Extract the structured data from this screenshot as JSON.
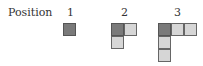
{
  "figure": {
    "row_label": "Position",
    "positions": [
      {
        "label": "1",
        "cells": [
          {
            "col": 0,
            "row": 0,
            "shade": "dark"
          }
        ]
      },
      {
        "label": "2",
        "cells": [
          {
            "col": 0,
            "row": 0,
            "shade": "dark"
          },
          {
            "col": 1,
            "row": 0,
            "shade": "light"
          },
          {
            "col": 0,
            "row": 1,
            "shade": "light"
          }
        ]
      },
      {
        "label": "3",
        "cells": [
          {
            "col": 0,
            "row": 0,
            "shade": "dark"
          },
          {
            "col": 1,
            "row": 0,
            "shade": "light"
          },
          {
            "col": 2,
            "row": 0,
            "shade": "light"
          },
          {
            "col": 0,
            "row": 1,
            "shade": "light"
          },
          {
            "col": 0,
            "row": 2,
            "shade": "light"
          }
        ]
      }
    ],
    "colors": {
      "dark": "#7a7a7a",
      "light": "#d6d6d6",
      "border": "#555555"
    }
  }
}
